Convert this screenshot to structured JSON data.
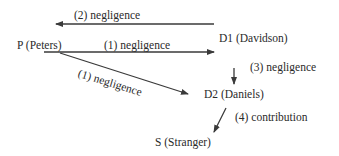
{
  "nodes": {
    "p": "P (Peters)",
    "d1": "D1 (Davidson)",
    "d2": "D2 (Daniels)",
    "s": "S (Stranger)"
  },
  "edges": {
    "d1_to_p": "(2) negligence",
    "p_to_d1": "(1) negligence",
    "p_to_d2": "(1) negligence",
    "d1_to_d2": "(3) negligence",
    "d2_to_s": "(4) contribution"
  },
  "colors": {
    "line": "#3a3a3a",
    "text": "#2a2a2a"
  }
}
